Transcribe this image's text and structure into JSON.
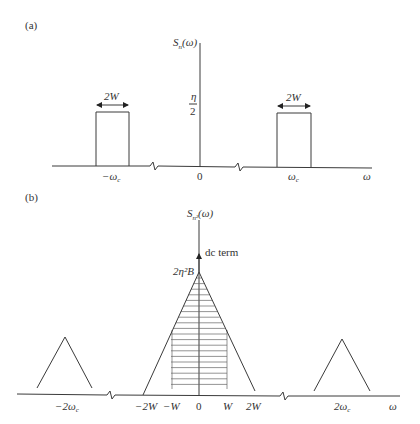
{
  "panel_a": {
    "label": "(a)",
    "y_axis_label": "S",
    "y_axis_sub": "n",
    "y_axis_arg": "(ω)",
    "level_numerator": "η",
    "level_denominator": "2",
    "width_label": "2W",
    "ticks": {
      "neg_wc": "−ω",
      "neg_wc_sub": "c",
      "zero": "0",
      "pos_wc": "ω",
      "pos_wc_sub": "c",
      "axis": "ω"
    }
  },
  "panel_b": {
    "label": "(b)",
    "y_axis_label": "S",
    "y_axis_sub": "n²",
    "y_axis_arg": "(ω)",
    "dc_label": "dc term",
    "peak_label": "2η²B",
    "ticks": {
      "neg_2wc": "−2ω",
      "neg_2wc_sub": "c",
      "neg_2W": "−2W",
      "neg_W": "−W",
      "zero": "0",
      "pos_W": "W",
      "pos_2W": "2W",
      "pos_2wc": "2ω",
      "pos_2wc_sub": "c",
      "axis": "ω"
    }
  }
}
